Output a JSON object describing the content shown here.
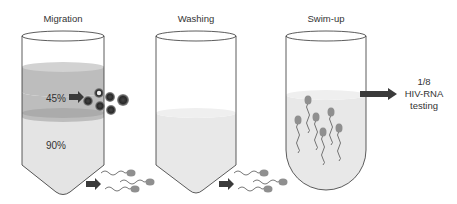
{
  "steps": [
    {
      "label": "Migration"
    },
    {
      "label": "Washing"
    },
    {
      "label": "Swim-up"
    }
  ],
  "gradient": {
    "upper_layer": "45%",
    "lower_layer": "90%"
  },
  "result": {
    "line1": "1/8",
    "line2": "HIV-RNA",
    "line3": "testing"
  },
  "colors": {
    "outline": "#333333",
    "layer_45": "#bdbdbd",
    "layer_90": "#e4e4e4",
    "liquid": "#e8e8e8",
    "arrow": "#3a3a3a",
    "sperm_head": "#8f8f8f"
  }
}
